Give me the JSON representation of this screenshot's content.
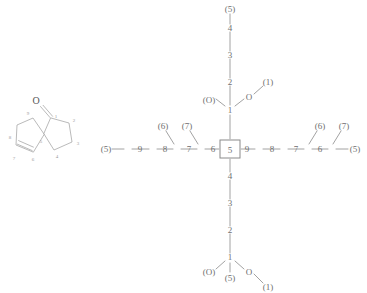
{
  "figure": {
    "structure": {
      "name": "spiro-ketone-structure",
      "carbonyl_oxygen": "O",
      "atom_labels": [
        "1",
        "2",
        "3",
        "4",
        "5",
        "6",
        "7",
        "8",
        "9"
      ],
      "ring_right_labels": [
        "1",
        "2",
        "3",
        "4"
      ],
      "ring_left_labels": [
        "6",
        "7",
        "8",
        "9"
      ],
      "spiro_label": "5"
    },
    "tree": {
      "name": "canonical-numbering-tree",
      "root": "5",
      "up_chain": [
        "1",
        "2",
        "3",
        "4",
        "5"
      ],
      "down_chain": [
        "1",
        "2",
        "3",
        "4"
      ],
      "left_chain": [
        "6",
        "7",
        "8",
        "9",
        "5"
      ],
      "right_chain": [
        "9",
        "8",
        "7",
        "6",
        "5"
      ],
      "up_substituents": {
        "left": "(O)",
        "right_atom": "O",
        "right_terminal": "(1)"
      },
      "down_substituents": {
        "left": "(O)",
        "below": "(5)",
        "right_atom": "O",
        "right_terminal": "(1)"
      },
      "left_branch_labels": [
        "(6)",
        "(7)"
      ],
      "right_branch_labels": [
        "(6)",
        "(7)"
      ],
      "top_terminal": "(5)",
      "left_terminal": "(5)",
      "right_terminal": "(5)"
    }
  },
  "nodes": {
    "root": "5",
    "up1": "1",
    "up2": "2",
    "up3": "3",
    "up4": "4",
    "upTerm": "(5)",
    "upO_left": "(O)",
    "upO_right": "O",
    "upO_right_term": "(1)",
    "dn1": "1",
    "dn2": "2",
    "dn3": "3",
    "dn4": "4",
    "dnO_left": "(O)",
    "dn_below": "(5)",
    "dnO_right": "O",
    "dnO_right_term": "(1)",
    "l6": "6",
    "l7": "7",
    "l8": "8",
    "l9": "9",
    "lTerm": "(5)",
    "lb6": "(6)",
    "lb7": "(7)",
    "r9": "9",
    "r8": "8",
    "r7": "7",
    "r6": "6",
    "rTerm": "(5)",
    "rb6": "(6)",
    "rb7": "(7)"
  },
  "structure_atoms": {
    "o": "O",
    "c1": "1",
    "c2": "2",
    "c3": "3",
    "c4": "4",
    "c5": "5",
    "c6": "6",
    "c7": "7",
    "c8": "8",
    "c9": "9"
  },
  "colors": {
    "line": "#8a8a8a",
    "text": "#6f6f6f",
    "background": "#ffffff",
    "structure_line": "#a6a6a6"
  }
}
